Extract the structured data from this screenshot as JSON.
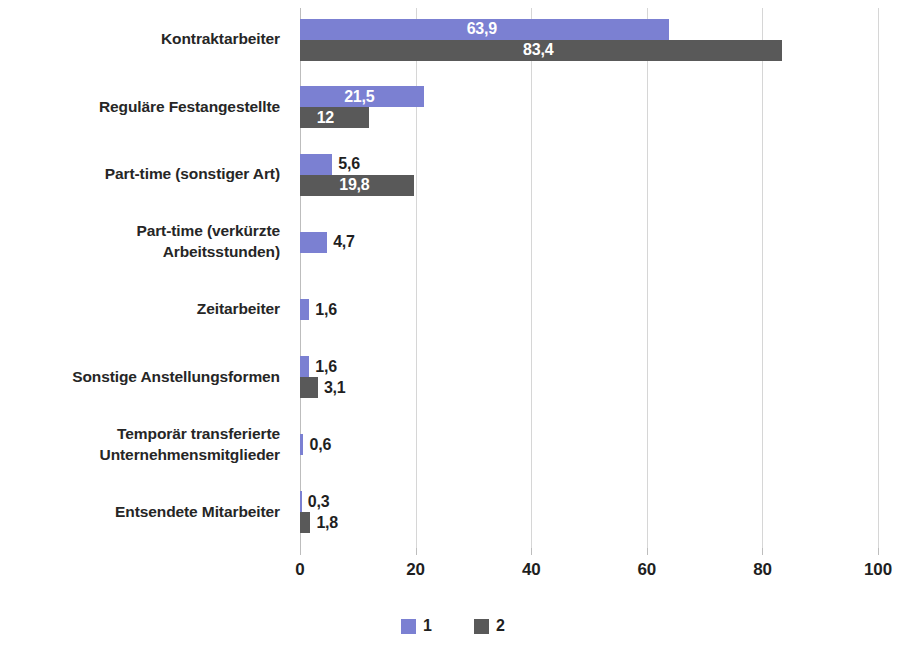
{
  "chart_data": {
    "type": "bar",
    "orientation": "horizontal",
    "title": "",
    "subtitle": "",
    "xlabel": "",
    "ylabel": "",
    "xlim": [
      0,
      100
    ],
    "xticks": [
      "0",
      "20",
      "40",
      "60",
      "80",
      "100"
    ],
    "grid": true,
    "legend_position": "bottom",
    "categories": [
      "Kontraktarbeiter",
      "Reguläre Festangestellte",
      "Part-time (sonstiger Art)",
      "Part-time (verkürzte Arbeitsstunden)",
      "Zeitarbeiter",
      "Sonstige Anstellungsformen",
      "Temporär transferierte Unternehmensmitglieder",
      "Entsendete Mitarbeiter"
    ],
    "series": [
      {
        "name": "1",
        "color": "#7b80d2",
        "values": [
          63.9,
          21.5,
          5.6,
          4.7,
          1.6,
          1.6,
          0.6,
          0.3
        ],
        "labels": [
          "63,9",
          "21,5",
          "5,6",
          "4,7",
          "1,6",
          "1,6",
          "0,6",
          "0,3"
        ]
      },
      {
        "name": "2",
        "color": "#595959",
        "values": [
          83.4,
          12,
          19.8,
          null,
          null,
          3.1,
          null,
          1.8
        ],
        "labels": [
          "83,4",
          "12",
          "19,8",
          "",
          "",
          "3,1",
          "",
          "1,8"
        ]
      }
    ]
  },
  "legend": {
    "items": [
      {
        "label": "1",
        "color": "#7b80d2"
      },
      {
        "label": "2",
        "color": "#595959"
      }
    ]
  },
  "axis": {
    "x_tick_labels": [
      "0",
      "20",
      "40",
      "60",
      "80",
      "100"
    ]
  },
  "categories_display": [
    {
      "lines": [
        "Kontraktarbeiter"
      ]
    },
    {
      "lines": [
        "Reguläre Festangestellte"
      ]
    },
    {
      "lines": [
        "Part-time (sonstiger Art)"
      ]
    },
    {
      "lines": [
        "Part-time (verkürzte",
        "Arbeitsstunden)"
      ]
    },
    {
      "lines": [
        "Zeitarbeiter"
      ]
    },
    {
      "lines": [
        "Sonstige Anstellungsformen"
      ]
    },
    {
      "lines": [
        "Temporär transferierte",
        "Unternehmensmitglieder"
      ]
    },
    {
      "lines": [
        "Entsendete Mitarbeiter"
      ]
    }
  ]
}
